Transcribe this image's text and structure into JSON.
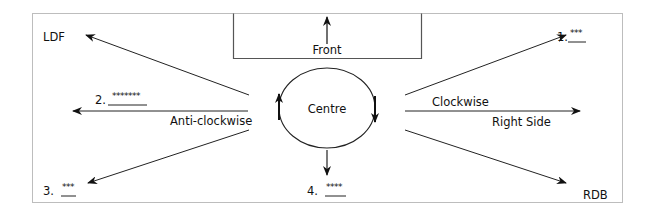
{
  "diagram": {
    "front_box": {
      "label": "Front"
    },
    "centre": {
      "label": "Centre"
    },
    "labels": {
      "ldf": "LDF",
      "rdb": "RDB",
      "anticlockwise": "Anti-clockwise",
      "clockwise": "Clockwise",
      "right_side": "Right Side"
    },
    "numbered": [
      {
        "num": "1.",
        "blank": "***"
      },
      {
        "num": "2.",
        "blank": "*******"
      },
      {
        "num": "3.",
        "blank": "***"
      },
      {
        "num": "4.",
        "blank": "****"
      }
    ],
    "colors": {
      "line": "#222222",
      "frame": "#bbbbbb",
      "box": "#555555"
    }
  }
}
